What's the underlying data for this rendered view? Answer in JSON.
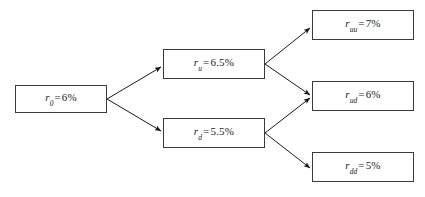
{
  "diagram": {
    "type": "binomial-interest-rate-tree",
    "background_color": "#ffffff",
    "border_color": "#3a3a3a",
    "arrow_color": "#1a1a1a",
    "text_color": "#1a1a1a",
    "nodes": [
      {
        "id": "r0",
        "symbol": "r",
        "subscript": "0",
        "equals": "=",
        "value": "6%",
        "level": 0,
        "full_text": "r0 = 6%"
      },
      {
        "id": "ru",
        "symbol": "r",
        "subscript": "u",
        "equals": "=",
        "value": "6.5%",
        "level": 1,
        "full_text": "ru = 6.5%"
      },
      {
        "id": "rd",
        "symbol": "r",
        "subscript": "d",
        "equals": "=",
        "value": "5.5%",
        "level": 1,
        "full_text": "rd = 5.5%"
      },
      {
        "id": "ruu",
        "symbol": "r",
        "subscript": "uu",
        "equals": "=",
        "value": "7%",
        "level": 2,
        "full_text": "ruu = 7%"
      },
      {
        "id": "rud",
        "symbol": "r",
        "subscript": "ud",
        "equals": "=",
        "value": "6%",
        "level": 2,
        "full_text": "rud = 6%"
      },
      {
        "id": "rdd",
        "symbol": "r",
        "subscript": "dd",
        "equals": "=",
        "value": "5%",
        "level": 2,
        "full_text": "rdd = 5%"
      }
    ],
    "edges": [
      {
        "from": "r0",
        "to": "ru",
        "direction": "up"
      },
      {
        "from": "r0",
        "to": "rd",
        "direction": "down"
      },
      {
        "from": "ru",
        "to": "ruu",
        "direction": "up"
      },
      {
        "from": "ru",
        "to": "rud",
        "direction": "down"
      },
      {
        "from": "rd",
        "to": "rud",
        "direction": "up"
      },
      {
        "from": "rd",
        "to": "rdd",
        "direction": "down"
      }
    ]
  }
}
